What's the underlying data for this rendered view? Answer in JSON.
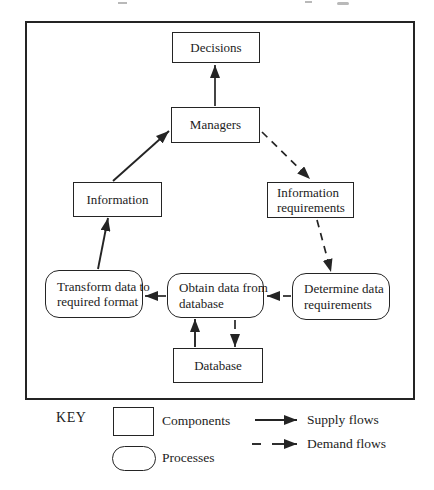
{
  "figure": {
    "nodes": {
      "decisions": {
        "label": "Decisions",
        "shape": "component"
      },
      "managers": {
        "label": "Managers",
        "shape": "component"
      },
      "information": {
        "label": "Information",
        "shape": "component"
      },
      "information_requirements": {
        "line1": "Information",
        "line2": "requirements",
        "shape": "component"
      },
      "database": {
        "label": "Database",
        "shape": "component"
      },
      "transform_data": {
        "line1": "Transform data to",
        "line2": "required format",
        "shape": "process"
      },
      "obtain_data": {
        "line1": "Obtain data from",
        "line2": "database",
        "shape": "process"
      },
      "determine_data": {
        "line1": "Determine data",
        "line2": "requirements",
        "shape": "process"
      }
    },
    "flows": {
      "supply": [
        {
          "from": "Managers",
          "to": "Decisions"
        },
        {
          "from": "Information",
          "to": "Managers"
        },
        {
          "from": "Transform data to required format",
          "to": "Information"
        },
        {
          "from": "Obtain data from database",
          "to": "Transform data to required format"
        },
        {
          "from": "Database",
          "to": "Obtain data from database"
        }
      ],
      "demand": [
        {
          "from": "Managers",
          "to": "Information requirements"
        },
        {
          "from": "Information requirements",
          "to": "Determine data requirements"
        },
        {
          "from": "Determine data requirements",
          "to": "Obtain data from database"
        },
        {
          "from": "Obtain data from database",
          "to": "Database"
        }
      ]
    }
  },
  "key": {
    "title": "KEY",
    "items": [
      {
        "symbol": "rectangle",
        "label": "Components"
      },
      {
        "symbol": "rounded-rectangle",
        "label": "Processes"
      },
      {
        "symbol": "solid-arrow",
        "label": "Supply flows"
      },
      {
        "symbol": "dashed-arrow",
        "label": "Demand flows"
      }
    ]
  },
  "colors": {
    "line": "#242424",
    "background": "#ffffff"
  }
}
